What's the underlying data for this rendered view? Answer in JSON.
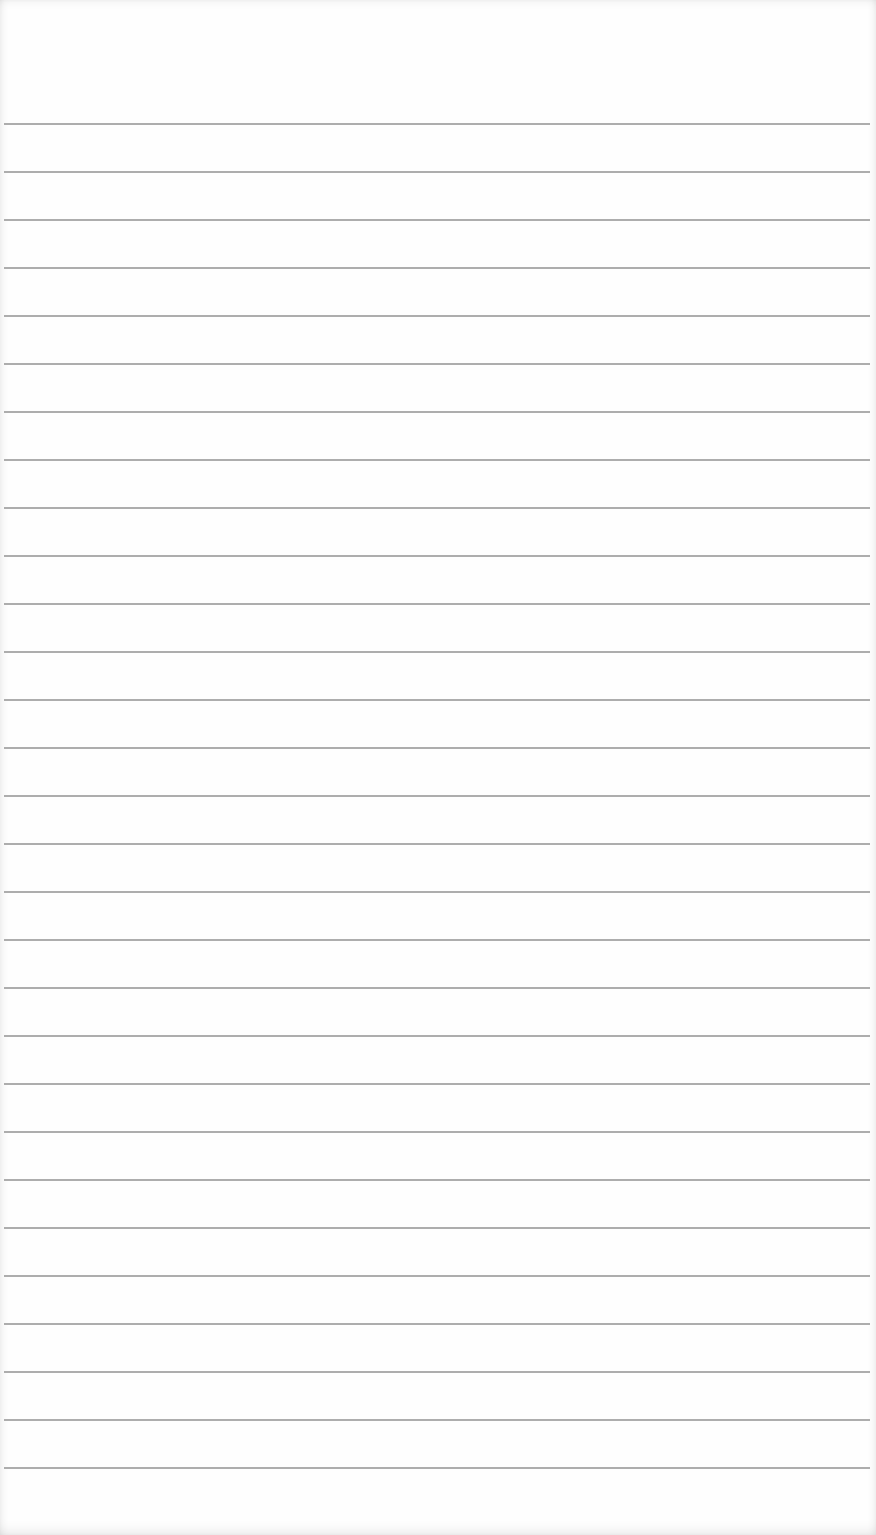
{
  "page": {
    "title": "",
    "description": "Blank ruled notebook paper"
  },
  "paper": {
    "background_color": "#fefefe",
    "line_color": "#a9a9a9",
    "line_count": 29,
    "first_line_y": 123,
    "line_spacing_px": 48,
    "line_thickness_px": 2
  }
}
